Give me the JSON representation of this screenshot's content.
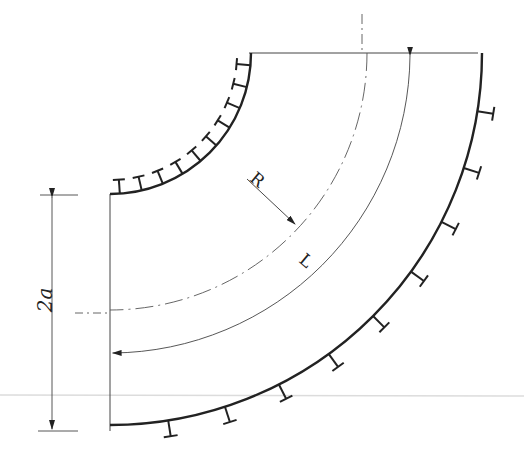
{
  "diagram": {
    "colors": {
      "ink": "#222222",
      "thin": "#444444",
      "artifact": "#d8d8d8",
      "background": "#ffffff"
    },
    "geometry": {
      "center": [
        110,
        53
      ],
      "inner_radius": 141,
      "outer_radius": 372,
      "centerline_radius": 257,
      "path_radius": 300
    },
    "labels": {
      "radius": "R",
      "length": "L",
      "width": "2a"
    },
    "inner_ticks_count": 10,
    "outer_ticks_count": 9
  }
}
